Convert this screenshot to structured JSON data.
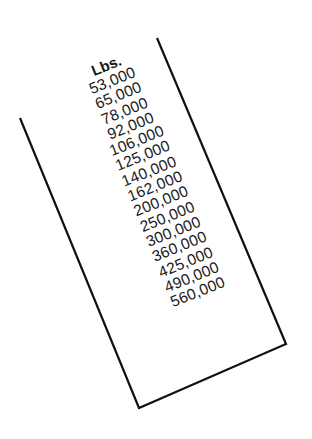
{
  "table": {
    "header": "Lbs.",
    "rows": [
      "53,000",
      "65,000",
      "78,000",
      "92,000",
      "106,000",
      "125,000",
      "140,000",
      "162,000",
      "200,000",
      "250,000",
      "300,000",
      "360,000",
      "425,000",
      "490,000",
      "560,000"
    ]
  },
  "colors": {
    "ink": "#1a1a1a",
    "background": "#ffffff"
  }
}
